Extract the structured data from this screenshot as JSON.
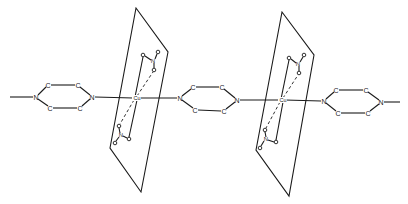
{
  "diagram": {
    "type": "chemical-structure",
    "labels": {
      "carbon": "C",
      "nitrogen": "N",
      "copper": "Cu",
      "oxygen": "o"
    },
    "pyrazine_rings": [
      {
        "id": "ring-left",
        "N_left": [
          36,
          97
        ],
        "C_top_left": [
          48,
          85
        ],
        "C_top_right": [
          78,
          85
        ],
        "N_right": [
          92,
          97
        ],
        "C_bottom_left": [
          50,
          108
        ],
        "C_bottom_right": [
          80,
          108
        ]
      },
      {
        "id": "ring-middle",
        "N_left": [
          180,
          98
        ],
        "C_top_left": [
          193,
          87
        ],
        "C_top_right": [
          222,
          87
        ],
        "N_right": [
          237,
          100
        ],
        "C_bottom_left": [
          195,
          110
        ],
        "C_bottom_right": [
          224,
          111
        ]
      },
      {
        "id": "ring-right",
        "N_left": [
          324,
          101
        ],
        "C_top_left": [
          336,
          90
        ],
        "C_top_right": [
          366,
          90
        ],
        "N_right": [
          381,
          102
        ],
        "C_bottom_left": [
          338,
          113
        ],
        "C_bottom_right": [
          368,
          113
        ]
      }
    ],
    "copper_centers": [
      {
        "id": "cu-1",
        "pos": [
          136,
          98
        ],
        "plane": [
          [
            136,
            8
          ],
          [
            168,
            52
          ],
          [
            141,
            192
          ],
          [
            110,
            148
          ]
        ],
        "nitrate_upper": {
          "O_bound": [
            143,
            55
          ],
          "N": [
            153,
            61
          ],
          "O_free": [
            158,
            52
          ],
          "O_bound2": [
            154,
            70
          ]
        },
        "nitrate_lower": {
          "O_bound": [
            119,
            126
          ],
          "N": [
            121,
            135
          ],
          "O_bound2": [
            129,
            139
          ],
          "O_free": [
            115,
            143
          ]
        }
      },
      {
        "id": "cu-2",
        "pos": [
          282,
          100
        ],
        "plane": [
          [
            282,
            12
          ],
          [
            314,
            55
          ],
          [
            289,
            196
          ],
          [
            256,
            150
          ]
        ],
        "nitrate_upper": {
          "O_bound": [
            289,
            58
          ],
          "N": [
            298,
            64
          ],
          "O_free": [
            304,
            55
          ],
          "O_bound2": [
            299,
            73
          ]
        },
        "nitrate_lower": {
          "O_bound": [
            265,
            130
          ],
          "N": [
            266,
            139
          ],
          "O_bound2": [
            276,
            142
          ],
          "O_free": [
            260,
            148
          ]
        }
      }
    ],
    "chain_ends": {
      "left": [
        10,
        97
      ],
      "right": [
        400,
        102
      ]
    }
  }
}
